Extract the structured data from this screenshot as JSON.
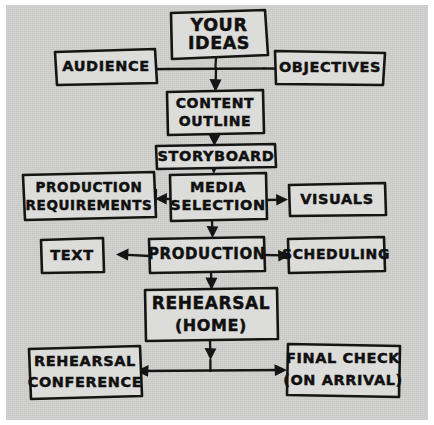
{
  "diagram": {
    "medium": "hand-drawn sketch",
    "paper_color": "#d2d2d0",
    "ink_color": "#151515",
    "nodes": [
      {
        "id": "your-ideas",
        "lines": [
          "YOUR",
          "IDEAS"
        ]
      },
      {
        "id": "audience",
        "lines": [
          "AUDIENCE"
        ]
      },
      {
        "id": "objectives",
        "lines": [
          "OBJECTIVES"
        ]
      },
      {
        "id": "content-outline",
        "lines": [
          "CONTENT",
          "OUTLINE"
        ]
      },
      {
        "id": "storyboard",
        "lines": [
          "STORYBOARD"
        ]
      },
      {
        "id": "production-requirements",
        "lines": [
          "PRODUCTION",
          "REQUIREMENTS"
        ]
      },
      {
        "id": "media-selection",
        "lines": [
          "MEDIA",
          "SELECTION"
        ]
      },
      {
        "id": "visuals",
        "lines": [
          "VISUALS"
        ]
      },
      {
        "id": "text",
        "lines": [
          "TEXT"
        ]
      },
      {
        "id": "production",
        "lines": [
          "PRODUCTION"
        ]
      },
      {
        "id": "scheduling",
        "lines": [
          "SCHEDULING"
        ]
      },
      {
        "id": "rehearsal-home",
        "lines": [
          "REHEARSAL",
          "(HOME)"
        ]
      },
      {
        "id": "rehearsal-conference",
        "lines": [
          "REHEARSAL",
          "CONFERENCE"
        ]
      },
      {
        "id": "final-check",
        "lines": [
          "FINAL CHECK",
          "(ON ARRIVAL)"
        ]
      }
    ],
    "edges": [
      {
        "from": "your-ideas",
        "to": "audience",
        "direction": "left"
      },
      {
        "from": "your-ideas",
        "to": "objectives",
        "direction": "right"
      },
      {
        "from": "your-ideas",
        "to": "content-outline",
        "direction": "down"
      },
      {
        "from": "content-outline",
        "to": "storyboard",
        "direction": "down"
      },
      {
        "from": "storyboard",
        "to": "media-selection",
        "direction": "down"
      },
      {
        "from": "media-selection",
        "to": "production-requirements",
        "direction": "left"
      },
      {
        "from": "media-selection",
        "to": "visuals",
        "direction": "right"
      },
      {
        "from": "media-selection",
        "to": "production",
        "direction": "down"
      },
      {
        "from": "production",
        "to": "text",
        "direction": "left"
      },
      {
        "from": "production",
        "to": "scheduling",
        "direction": "right"
      },
      {
        "from": "production",
        "to": "rehearsal-home",
        "direction": "down"
      },
      {
        "from": "rehearsal-home",
        "to": "rehearsal-conference",
        "direction": "down-left"
      },
      {
        "from": "rehearsal-home",
        "to": "final-check",
        "direction": "down-right"
      }
    ]
  }
}
